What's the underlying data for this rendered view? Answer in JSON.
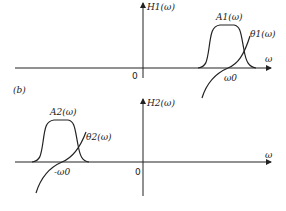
{
  "figure": {
    "panel_label": "(b)",
    "top_plot": {
      "y_axis_label": "H1(ω)",
      "x_axis_label": "ω",
      "origin_label": "0",
      "amplitude_label": "A1(ω)",
      "phase_label": "θ1(ω)",
      "center_label": "ω0"
    },
    "bottom_plot": {
      "y_axis_label": "H2(ω)",
      "x_axis_label": "ω",
      "origin_label": "0",
      "amplitude_label": "A2(ω)",
      "phase_label": "θ2(ω)",
      "center_label": "-ω0"
    }
  }
}
